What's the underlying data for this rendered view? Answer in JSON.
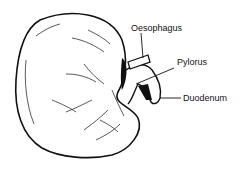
{
  "diagram": {
    "labels": {
      "oesophagus": "Oesophagus",
      "pylorus": "Pylorus",
      "duodenum": "Duodenum"
    },
    "colors": {
      "line": "#111111",
      "background": "#ffffff"
    }
  }
}
